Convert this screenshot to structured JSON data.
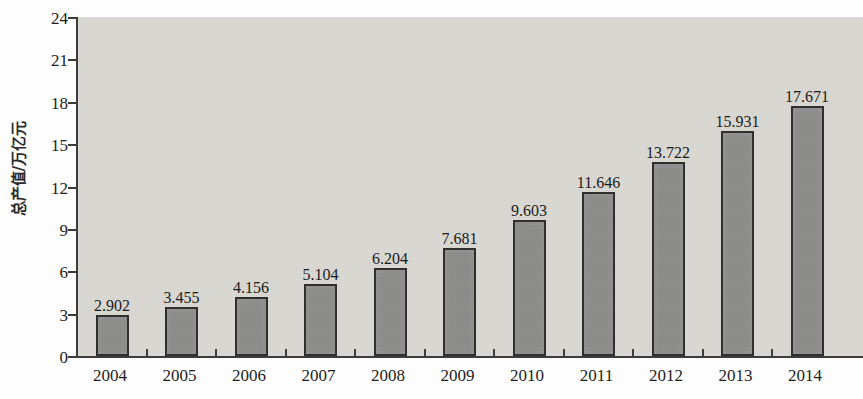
{
  "chart_data": {
    "type": "bar",
    "title": "",
    "subtitle": "",
    "xlabel": "",
    "ylabel": "总产值/万亿元",
    "categories": [
      "2004",
      "2005",
      "2006",
      "2007",
      "2008",
      "2009",
      "2010",
      "2011",
      "2012",
      "2013",
      "2014"
    ],
    "values": [
      2.902,
      3.455,
      4.156,
      5.104,
      6.204,
      7.681,
      9.603,
      11.646,
      13.722,
      15.931,
      17.671
    ],
    "value_labels": [
      "2.902",
      "3.455",
      "4.156",
      "5.104",
      "6.204",
      "7.681",
      "9.603",
      "11.646",
      "13.722",
      "15.931",
      "17.671"
    ],
    "ylim": [
      0,
      24
    ],
    "yticks": [
      0,
      3,
      6,
      9,
      12,
      15,
      18,
      21,
      24
    ],
    "ytick_labels": [
      "0",
      "3",
      "6",
      "9",
      "12",
      "15",
      "18",
      "21",
      "24"
    ],
    "grid": false,
    "legend": null,
    "bar_color": "#8d8d8b",
    "bar_edge_color": "#2f2f2f",
    "plot_background": "#d9d8d3",
    "figure_background": "#fdfdfd",
    "axis_color": "#3d3d3d",
    "text_color": "#1a1a1a"
  }
}
